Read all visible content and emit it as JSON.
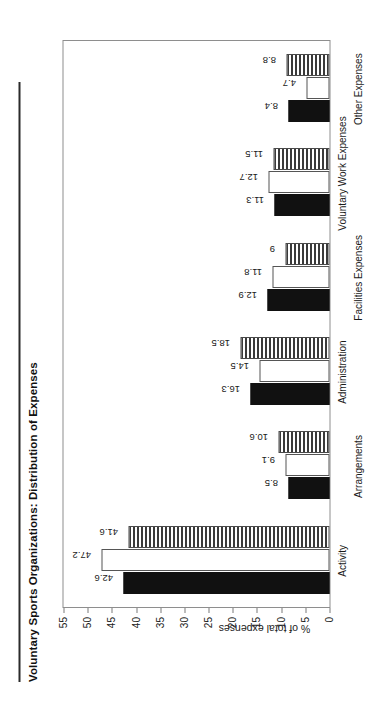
{
  "document": {
    "title": "Voluntary Sports Organizations: Distribution of Expenses",
    "rule": "horizontal-rule"
  },
  "chart_data": {
    "type": "bar",
    "title": "Voluntary Sports Organizations: Distribution of Expenses",
    "xlabel": "",
    "ylabel": "% of total expenses",
    "ylim": [
      0,
      55
    ],
    "ytick_labels": [
      "0",
      "5",
      "10",
      "15",
      "20",
      "25",
      "30",
      "35",
      "40",
      "45",
      "50",
      "55"
    ],
    "ytick_values": [
      0,
      5,
      10,
      15,
      20,
      25,
      30,
      35,
      40,
      45,
      50,
      55
    ],
    "grid": false,
    "legend": "none",
    "orientation": "vertical-bars-rotated-page",
    "categories": [
      "Activity",
      "Arrangements",
      "Administration",
      "Facilities Expenses",
      "Voluntary Work Expenses",
      "Other Expenses"
    ],
    "series": [
      {
        "name": "series-1",
        "fill": "solid-black",
        "color": "#111111",
        "values": [
          42.6,
          8.5,
          16.3,
          12.9,
          11.3,
          8.4
        ],
        "labels": [
          "42.6",
          "8.5",
          "16.3",
          "12.9",
          "11.3",
          "8.4"
        ]
      },
      {
        "name": "series-2",
        "fill": "white",
        "color": "#ffffff",
        "values": [
          47.2,
          9.1,
          14.5,
          11.8,
          12.7,
          4.7
        ],
        "labels": [
          "47.2",
          "9.1",
          "14.5",
          "11.8",
          "12.7",
          "4.7"
        ]
      },
      {
        "name": "series-3",
        "fill": "horizontal-hatch",
        "color": "#3a3a3a",
        "values": [
          41.6,
          10.6,
          18.5,
          9,
          11.5,
          8.8
        ],
        "labels": [
          "41.6",
          "10.6",
          "18.5",
          "9",
          "11.5",
          "8.8"
        ]
      }
    ]
  }
}
